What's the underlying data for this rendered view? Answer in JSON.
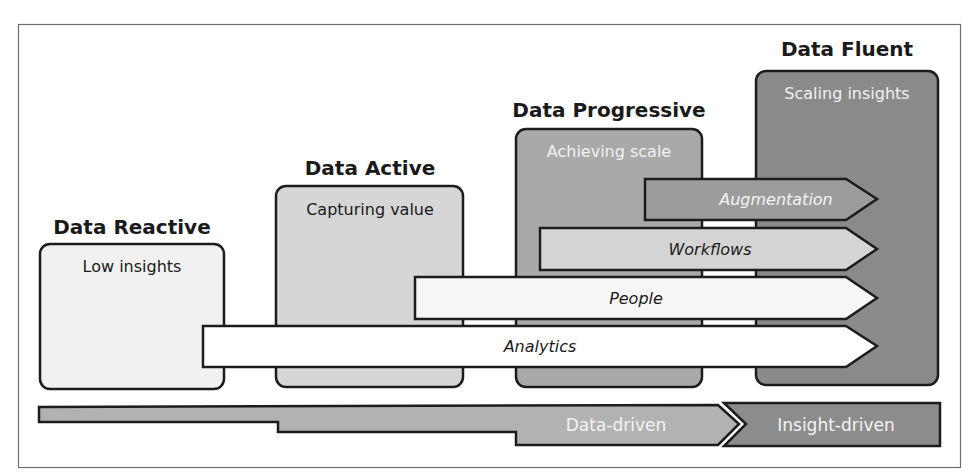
{
  "diagram": {
    "top_cut_text": "can be as ...",
    "colors": {
      "frame": "#6e6e6e",
      "stroke": "#1c1c1c",
      "reactive_fill": "#f1f1f1",
      "active_fill": "#d6d6d6",
      "progressive_fill": "#a9a9a9",
      "fluent_fill": "#8a8a8a",
      "augmentation_fill": "#9c9c9c",
      "workflows_fill": "#d4d4d4",
      "people_fill": "#f6f6f6",
      "analytics_fill": "#ffffff",
      "data_driven_fill": "#b2b2b2",
      "insight_driven_fill": "#8c8c8c"
    },
    "stages": [
      {
        "id": "reactive",
        "title": "Data Reactive",
        "subtitle": "Low insights"
      },
      {
        "id": "active",
        "title": "Data Active",
        "subtitle": "Capturing value"
      },
      {
        "id": "progressive",
        "title": "Data Progressive",
        "subtitle": "Achieving scale"
      },
      {
        "id": "fluent",
        "title": "Data Fluent",
        "subtitle": "Scaling insights"
      }
    ],
    "arrows": [
      {
        "id": "augmentation",
        "label": "Augmentation"
      },
      {
        "id": "workflows",
        "label": "Workflows"
      },
      {
        "id": "people",
        "label": "People"
      },
      {
        "id": "analytics",
        "label": "Analytics"
      }
    ],
    "bottom_bar": {
      "data_driven": "Data-driven",
      "insight_driven": "Insight-driven"
    }
  }
}
